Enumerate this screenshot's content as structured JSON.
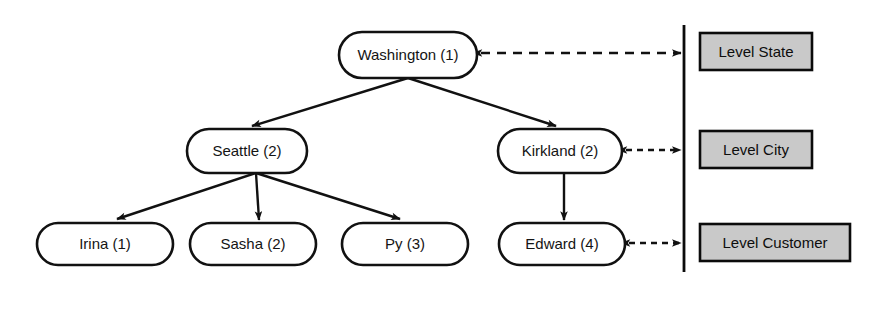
{
  "diagram": {
    "colors": {
      "node_fill": "#ffffff",
      "node_stroke": "#111111",
      "level_box_fill": "#c9c9c9",
      "level_box_stroke": "#0b0b0b",
      "edge": "#111111",
      "background": "#ffffff"
    },
    "nodes": [
      {
        "id": "washington",
        "label": "Washington (1)",
        "level": "state",
        "cx": 408,
        "cy": 55,
        "rx": 69,
        "ry": 23
      },
      {
        "id": "seattle",
        "label": "Seattle (2)",
        "level": "city",
        "cx": 247,
        "cy": 151,
        "rx": 60,
        "ry": 22
      },
      {
        "id": "kirkland",
        "label": "Kirkland (2)",
        "level": "city",
        "cx": 560,
        "cy": 151,
        "rx": 62,
        "ry": 22
      },
      {
        "id": "irina",
        "label": "Irina (1)",
        "level": "customer",
        "cx": 105,
        "cy": 244,
        "rx": 68,
        "ry": 21
      },
      {
        "id": "sasha",
        "label": "Sasha (2)",
        "level": "customer",
        "cx": 253,
        "cy": 244,
        "rx": 63,
        "ry": 21
      },
      {
        "id": "py",
        "label": "Py (3)",
        "level": "customer",
        "cx": 405,
        "cy": 244,
        "rx": 63,
        "ry": 21
      },
      {
        "id": "edward",
        "label": "Edward (4)",
        "level": "customer",
        "cx": 562,
        "cy": 244,
        "rx": 63,
        "ry": 21
      }
    ],
    "edges": [
      {
        "from": "washington",
        "to": "seattle"
      },
      {
        "from": "washington",
        "to": "kirkland"
      },
      {
        "from": "seattle",
        "to": "irina"
      },
      {
        "from": "seattle",
        "to": "sasha"
      },
      {
        "from": "seattle",
        "to": "py"
      },
      {
        "from": "kirkland",
        "to": "edward"
      }
    ],
    "levels": [
      {
        "id": "state",
        "label": "Level State",
        "box_x": 700,
        "box_y": 33,
        "box_w": 112,
        "box_h": 37,
        "link_from": "washington",
        "link_x1": 481,
        "link_y": 53,
        "link_x2": 681
      },
      {
        "id": "city",
        "label": "Level City",
        "box_x": 700,
        "box_y": 131,
        "box_w": 112,
        "box_h": 37,
        "link_from": "kirkland",
        "link_x1": 626,
        "link_y": 150,
        "link_x2": 681
      },
      {
        "id": "customer",
        "label": "Level Customer",
        "box_x": 700,
        "box_y": 224,
        "box_w": 150,
        "box_h": 37,
        "link_from": "edward",
        "link_x1": 629,
        "link_y": 243,
        "link_x2": 681
      }
    ],
    "divider": {
      "x": 684,
      "y1": 25,
      "y2": 272
    }
  }
}
